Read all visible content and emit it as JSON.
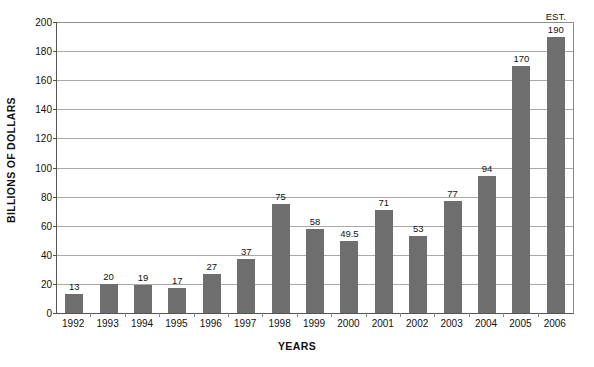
{
  "chart_data": {
    "type": "bar",
    "title": "",
    "subtitle": "",
    "xlabel": "YEARS",
    "ylabel": "BILLIONS OF DOLLARS",
    "categories": [
      "1992",
      "1993",
      "1994",
      "1995",
      "1996",
      "1997",
      "1998",
      "1999",
      "2000",
      "2001",
      "2002",
      "2003",
      "2004",
      "2005",
      "2006"
    ],
    "values": [
      13,
      20,
      19,
      17,
      27,
      37,
      75,
      58,
      49.5,
      71,
      53,
      77,
      94,
      170,
      190
    ],
    "value_labels": [
      "13",
      "20",
      "19",
      "17",
      "27",
      "37",
      "75",
      "58",
      "49.5",
      "71",
      "53",
      "77",
      "94",
      "170",
      "190"
    ],
    "annotations": [
      {
        "category": "2006",
        "text": "EST."
      }
    ],
    "ylim": [
      0,
      200
    ],
    "ytick_step": 20,
    "ytick_labels": [
      "200",
      "180",
      "160",
      "140",
      "120",
      "100",
      "80",
      "60",
      "40",
      "20",
      "0"
    ],
    "ytick_values": [
      200,
      180,
      160,
      140,
      120,
      100,
      80,
      60,
      40,
      20,
      0
    ],
    "grid": "horizontal",
    "legend": "none",
    "bar_color": "#6e6e6e",
    "gridline_color": "#a8a8a8",
    "axis_color": "#555555",
    "background_color": "#ffffff"
  }
}
